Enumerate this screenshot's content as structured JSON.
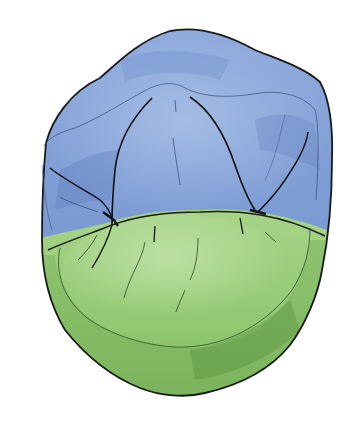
{
  "figure": {
    "regions": [
      {
        "name": "upper-region",
        "color": "#7f9fd6",
        "shade": "#5d7fbd",
        "highlight": "#a9bfe6"
      },
      {
        "name": "lower-region",
        "color": "#8cc46a",
        "shade": "#5f9c45",
        "highlight": "#b2da95"
      }
    ],
    "outline_color": "#1a1a1a",
    "background": "#ffffff"
  }
}
